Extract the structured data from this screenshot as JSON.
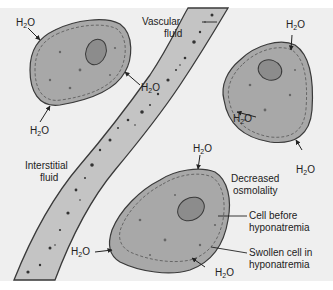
{
  "diagram": {
    "colors": {
      "background": "#efefef",
      "cell_fill": "#a8a8a8",
      "nucleus_fill": "#8c8c8c",
      "vessel_fill": "#c4c4c4",
      "outline": "#3a3a3a"
    },
    "labels": {
      "vascular_fluid_1": "Vascular",
      "vascular_fluid_2": "fluid",
      "interstitial_fluid_1": "Interstitial",
      "interstitial_fluid_2": "fluid",
      "decreased_osmolality_1": "Decreased",
      "decreased_osmolality_2": "osmolality",
      "cell_before_1": "Cell before",
      "cell_before_2": "hyponatremia",
      "swollen_cell_1": "Swollen cell in",
      "swollen_cell_2": "hyponatremia"
    },
    "water": {
      "h": "H",
      "sub": "2",
      "o": "O"
    }
  }
}
